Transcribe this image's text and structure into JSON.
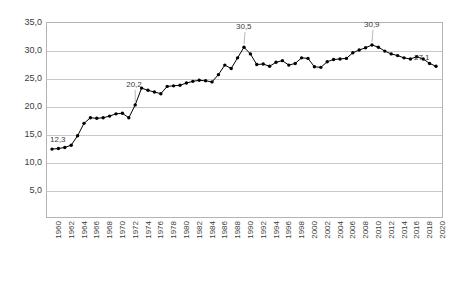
{
  "chart_data": {
    "type": "line",
    "title": "",
    "xlabel": "",
    "ylabel": "",
    "ylim": [
      0,
      35
    ],
    "ytick_labels": [
      "35,0",
      "30,0",
      "25,0",
      "20,0",
      "15,0",
      "10,0",
      "5,0"
    ],
    "ytick_values": [
      35,
      30,
      25,
      20,
      15,
      10,
      5
    ],
    "grid": true,
    "legend": "none",
    "marker": "filled-circle",
    "line_color": "#000000",
    "marker_color": "#000000",
    "xtick_labels": [
      "1960",
      "1962",
      "1964",
      "1966",
      "1968",
      "1970",
      "1972",
      "1974",
      "1976",
      "1978",
      "1980",
      "1982",
      "1984",
      "1986",
      "1988",
      "1990",
      "1992",
      "1994",
      "1996",
      "1998",
      "2000",
      "2002",
      "2004",
      "2006",
      "2008",
      "2010",
      "2012",
      "2014",
      "2016",
      "2018",
      "2020"
    ],
    "categories": [
      1960,
      1961,
      1962,
      1963,
      1964,
      1965,
      1966,
      1967,
      1968,
      1969,
      1970,
      1971,
      1972,
      1973,
      1974,
      1975,
      1976,
      1977,
      1978,
      1979,
      1980,
      1981,
      1982,
      1983,
      1984,
      1985,
      1986,
      1987,
      1988,
      1989,
      1990,
      1991,
      1992,
      1993,
      1994,
      1995,
      1996,
      1997,
      1998,
      1999,
      2000,
      2001,
      2002,
      2003,
      2004,
      2005,
      2006,
      2007,
      2008,
      2009,
      2010,
      2011,
      2012,
      2013,
      2014,
      2015,
      2016,
      2017,
      2018,
      2019,
      2020
    ],
    "values": [
      12.3,
      12.4,
      12.6,
      13.0,
      14.7,
      16.9,
      17.9,
      17.8,
      17.9,
      18.2,
      18.6,
      18.7,
      17.9,
      20.2,
      23.2,
      22.8,
      22.5,
      22.2,
      23.5,
      23.6,
      23.7,
      24.1,
      24.4,
      24.6,
      24.5,
      24.3,
      25.6,
      27.3,
      26.7,
      28.6,
      30.5,
      29.3,
      27.4,
      27.5,
      27.1,
      27.8,
      28.1,
      27.3,
      27.6,
      28.6,
      28.5,
      27.0,
      26.9,
      27.9,
      28.3,
      28.4,
      28.5,
      29.5,
      30.0,
      30.4,
      30.9,
      30.5,
      29.8,
      29.3,
      29.0,
      28.6,
      28.4,
      28.8,
      28.4,
      27.6,
      27.1
    ],
    "point_labels": [
      {
        "year": 1960,
        "text": "12,3"
      },
      {
        "year": 1973,
        "text": "20,2"
      },
      {
        "year": 1990,
        "text": "30,5"
      },
      {
        "year": 2010,
        "text": "30,9"
      },
      {
        "year": 2020,
        "text": "27,1"
      }
    ]
  }
}
